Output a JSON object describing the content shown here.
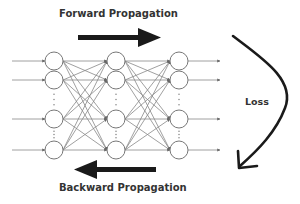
{
  "labels": {
    "forward": "Forward Propagation",
    "backward": "Backward Propagation",
    "loss": "Loss"
  },
  "network": {
    "layers": [
      {
        "x": 54,
        "nodes_y": [
          61,
          80,
          119,
          150
        ]
      },
      {
        "x": 116,
        "nodes_y": [
          61,
          80,
          119,
          150
        ]
      },
      {
        "x": 179,
        "nodes_y": [
          61,
          80,
          119,
          150
        ]
      }
    ],
    "node_radius": 9,
    "input_x": 12,
    "output_x": 220
  },
  "colors": {
    "arrow": "#1a1a1a",
    "edge": "#888888",
    "node_stroke": "#777777",
    "text": "#333333"
  }
}
